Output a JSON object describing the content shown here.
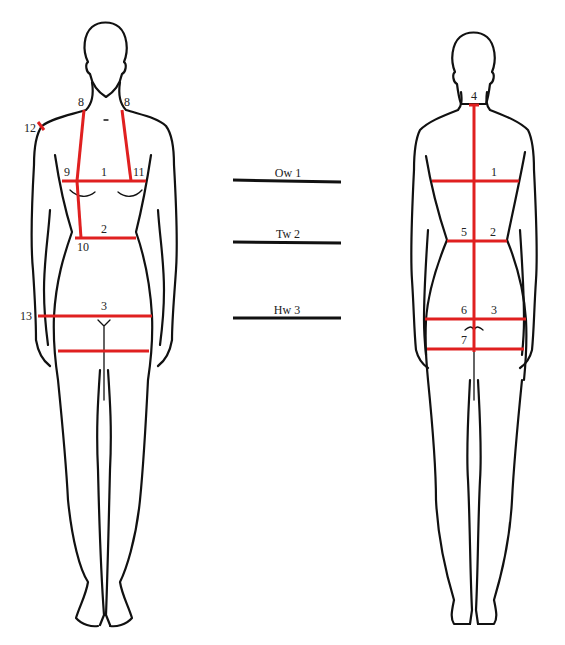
{
  "colors": {
    "measurement_line": "#e02020",
    "outline": "#111111",
    "text": "#222222",
    "background": "#ffffff"
  },
  "front_figure": {
    "labels": {
      "shoulder_neck_left": "8",
      "shoulder_neck_right": "8",
      "shoulder_point": "12",
      "bust_left": "9",
      "bust_center": "1",
      "bust_right": "11",
      "waist_center": "2",
      "waist_left": "10",
      "hip_center": "3",
      "hip_side": "13"
    }
  },
  "legend": {
    "items": [
      {
        "label": "Ow 1"
      },
      {
        "label": "Tw 2"
      },
      {
        "label": "Hw 3"
      }
    ]
  },
  "back_figure": {
    "labels": {
      "neck_back": "4",
      "bust_back": "1",
      "waist_center": "5",
      "waist_side": "2",
      "hip_center": "6",
      "hip_side": "3",
      "seat": "7"
    }
  }
}
